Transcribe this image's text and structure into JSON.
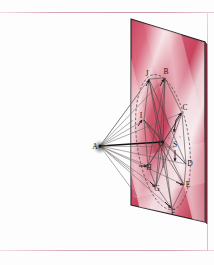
{
  "figure": {
    "plane": {
      "fill_color": "#cf5369",
      "edge_color": "#2b2020",
      "band_light": "#f0d3d8",
      "band_dark": "#c0405a",
      "corners": {
        "top_left": [
          131,
          19
        ],
        "top_right": [
          205,
          42
        ],
        "bottom_right": [
          205,
          222
        ],
        "bottom_left": [
          131,
          205
        ]
      }
    },
    "apex": {
      "id": "A",
      "label": "A",
      "x": 99,
      "y": 146
    },
    "center": {
      "id": "O",
      "label": "O",
      "x": 163,
      "y": 142
    },
    "secondary_center": {
      "id": "S",
      "label": "S",
      "x": 174,
      "y": 143
    },
    "points": [
      {
        "id": "J",
        "label": "J",
        "x": 147,
        "y": 76
      },
      {
        "id": "B",
        "label": "B",
        "x": 163,
        "y": 74
      },
      {
        "id": "I",
        "label": "I",
        "x": 142,
        "y": 118
      },
      {
        "id": "C",
        "label": "C",
        "x": 183,
        "y": 110
      },
      {
        "id": "D",
        "label": "D",
        "x": 188,
        "y": 163
      },
      {
        "id": "E",
        "label": "E",
        "x": 186,
        "y": 184
      },
      {
        "id": "F",
        "label": "F",
        "x": 171,
        "y": 211
      },
      {
        "id": "G",
        "label": "G",
        "x": 154,
        "y": 187
      },
      {
        "id": "H",
        "label": "H",
        "x": 146,
        "y": 164
      }
    ],
    "ellipse": {
      "center": [
        163,
        142
      ],
      "rx": 26,
      "ry": 68,
      "rotation_deg": -8,
      "stroke": "#4a4040",
      "dashed": true
    },
    "ray_color": "#6b6363",
    "chord_color": "#4d4747",
    "axis_color": "#141010",
    "angle_marks": [
      "°",
      "°"
    ]
  },
  "page": {
    "background": "#fdfdfd",
    "rule_color": "#dcaebe"
  }
}
